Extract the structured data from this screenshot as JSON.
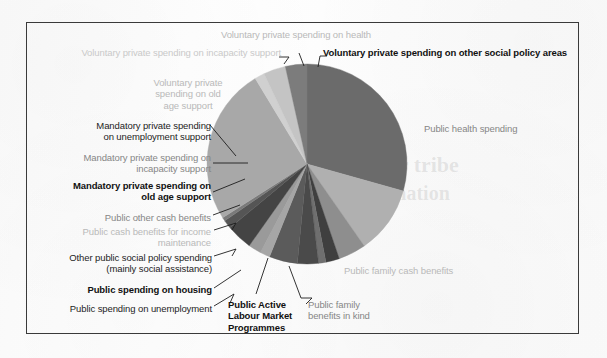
{
  "figure": {
    "type": "pie-chart-figure",
    "border_color": "#3a3a3a",
    "background": "#fdfdfd"
  },
  "bleed_through": [
    {
      "text": "lower tribe",
      "x": 356,
      "y": 152
    },
    {
      "text": "nomination",
      "x": 352,
      "y": 182
    }
  ],
  "chart_data": {
    "type": "pie",
    "title": "",
    "subtitle": "",
    "xlabel": "",
    "ylabel": "",
    "legend_position": "callout-labels",
    "grid": false,
    "center": {
      "x": 280,
      "y": 141
    },
    "radius": 100,
    "start_angle_deg": -90,
    "direction": "clockwise",
    "categories": [
      "Public health spending",
      "Public family cash benefits",
      "Public family benefits in kind",
      "Public Active Labour Market Programmes",
      "Public spending on unemployment",
      "Public spending on housing",
      "Other public social policy spending (mainly social assistance)",
      "Public cash benefits for income maintenance",
      "Public other cash benefits",
      "Mandatory private spending on old age support",
      "Mandatory private spending on incapacity support",
      "Mandatory private spending on unemployment support",
      "Voluntary private spending on old age support",
      "Voluntary private spending on incapacity support",
      "Voluntary private spending on health",
      "Voluntary private spending on other social policy areas"
    ],
    "values": [
      29.5,
      11.0,
      4.5,
      2.2,
      1.2,
      3.4,
      4.6,
      1.6,
      2.1,
      4.2,
      1.4,
      0.6,
      25.5,
      1.6,
      3.6,
      3.5
    ],
    "colors": [
      "#6b6b6b",
      "#b0b0b0",
      "#8e8e8e",
      "#3f3f3f",
      "#6f6f6f",
      "#4a4a4a",
      "#5b5b5b",
      "#a6a6a6",
      "#9a9a9a",
      "#444444",
      "#555555",
      "#7a7a7a",
      "#a8a8a8",
      "#d0d0d0",
      "#c4c4c4",
      "#7c7c7c"
    ]
  },
  "labels": [
    {
      "id": "voluntary-private-health",
      "text": "Voluntary private spending on health",
      "style": "t-light",
      "align": "a-center",
      "x": 174,
      "y": 6,
      "w": 190
    },
    {
      "id": "voluntary-private-incapacity",
      "text": "Voluntary private spending on incapacity support",
      "style": "t-lighter",
      "align": "a-right",
      "x": 10,
      "y": 24,
      "w": 244
    },
    {
      "id": "voluntary-private-other-policy",
      "text": "Voluntary private spending on other social policy areas",
      "style": "t-bold",
      "align": "a-left",
      "x": 296,
      "y": 24,
      "w": 262
    },
    {
      "id": "voluntary-private-old-age",
      "text": "Voluntary private\nspending on old\nage support",
      "style": "t-light",
      "align": "a-center",
      "x": 111,
      "y": 54,
      "w": 100
    },
    {
      "id": "mandatory-private-unemployment",
      "text": "Mandatory private spending\non unemployment support",
      "style": "t-dark",
      "align": "a-right",
      "x": 22,
      "y": 97,
      "w": 162
    },
    {
      "id": "mandatory-private-incapacity",
      "text": "Mandatory private spending on\nincapacity support",
      "style": "t-gray",
      "align": "a-right",
      "x": 12,
      "y": 129,
      "w": 172
    },
    {
      "id": "mandatory-private-old-age",
      "text": "Mandatory private spending on\nold age support",
      "style": "t-bold",
      "align": "a-right",
      "x": 12,
      "y": 157,
      "w": 172
    },
    {
      "id": "public-other-cash-benefits",
      "text": "Public other cash benefits",
      "style": "t-gray",
      "align": "a-right",
      "x": 28,
      "y": 189,
      "w": 156
    },
    {
      "id": "public-cash-income-maintenance",
      "text": "Public cash benefits for income\nmaintenance",
      "style": "t-light",
      "align": "a-right",
      "x": 12,
      "y": 203,
      "w": 172
    },
    {
      "id": "other-public-social-policy",
      "text": "Other public social policy spending\n(mainly social assistance)",
      "style": "t-dark",
      "align": "a-right",
      "x": 5,
      "y": 229,
      "w": 180
    },
    {
      "id": "public-spending-housing",
      "text": "Public spending on housing",
      "style": "t-bold",
      "align": "a-right",
      "x": 28,
      "y": 261,
      "w": 157
    },
    {
      "id": "public-spending-unemployment",
      "text": "Public spending on unemployment",
      "style": "t-dark",
      "align": "a-right",
      "x": 8,
      "y": 280,
      "w": 177
    },
    {
      "id": "public-active-labour-market",
      "text": "Public Active\nLabour Market\nProgrammes",
      "style": "t-bold",
      "align": "a-left",
      "x": 201,
      "y": 276,
      "w": 90
    },
    {
      "id": "public-family-benefits-in-kind",
      "text": "Public family\nbenefits in kind",
      "style": "t-gray",
      "align": "a-left",
      "x": 281,
      "y": 276,
      "w": 92
    },
    {
      "id": "public-family-cash-benefits",
      "text": "Public family cash benefits",
      "style": "t-light",
      "align": "a-left",
      "x": 317,
      "y": 242,
      "w": 160
    },
    {
      "id": "public-health-spending",
      "text": "Public health spending",
      "style": "t-gray",
      "align": "a-left",
      "x": 397,
      "y": 100,
      "w": 150
    }
  ],
  "leader_lines": [
    {
      "id": "leader-voluntary-incapacity",
      "points": "257,41 262,34 252,34"
    },
    {
      "id": "leader-voluntary-health",
      "points": "277,43 272,30"
    },
    {
      "id": "leader-voluntary-other",
      "points": "291,44 293,33 300,33"
    },
    {
      "id": "leader-mandatory-unemployment",
      "points": "183,102 209,133"
    },
    {
      "id": "leader-mandatory-incapacity",
      "points": "186,140 221,140"
    },
    {
      "id": "leader-mandatory-old-age",
      "points": "186,169 218,156"
    },
    {
      "id": "leader-public-other-cash",
      "points": "186,192 213,182"
    },
    {
      "id": "leader-public-cash-income",
      "points": "187,207 209,200 205,207"
    },
    {
      "id": "leader-other-public-social",
      "points": "187,233 209,226 205,233"
    },
    {
      "id": "leader-public-housing",
      "points": "187,265 214,247"
    },
    {
      "id": "leader-public-unemployment",
      "points": "187,283 207,271 203,280"
    },
    {
      "id": "leader-public-almp",
      "points": "229,271 241,235"
    },
    {
      "id": "leader-family-benefits-kind",
      "points": "279,281 285,275 274,275"
    },
    {
      "id": "leader-family-kind-stem",
      "points": "274,275 262,243"
    }
  ]
}
